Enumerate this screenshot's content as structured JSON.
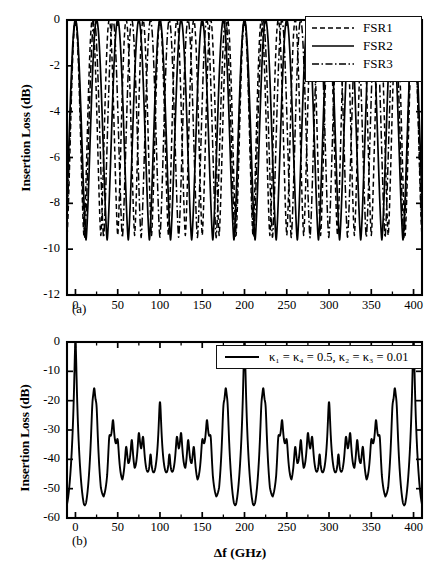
{
  "figure": {
    "xlabel": "Δf (GHz)",
    "panel_a_tag": "(a)",
    "panel_b_tag": "(b)"
  },
  "panel_a": {
    "ylabel": "Insertion Loss (dB)",
    "yticks": [
      "0",
      "-2",
      "-4",
      "-6",
      "-8",
      "-10",
      "-12"
    ],
    "xticks": [
      "0",
      "50",
      "100",
      "150",
      "200",
      "250",
      "300",
      "350",
      "400"
    ],
    "legend": [
      {
        "label": "FSR1",
        "style": "dashed"
      },
      {
        "label": "FSR2",
        "style": "solid"
      },
      {
        "label": "FSR3",
        "style": "dashdot"
      }
    ]
  },
  "panel_b": {
    "ylabel": "Insertion Loss (dB)",
    "yticks": [
      "0",
      "-10",
      "-20",
      "-30",
      "-40",
      "-50",
      "-60"
    ],
    "xticks": [
      "0",
      "50",
      "100",
      "150",
      "200",
      "250",
      "300",
      "350",
      "400"
    ],
    "legend_label": "κ₁ = κ₄ = 0.5, κ₂ = κ₃ = 0.01"
  },
  "chart_data": [
    {
      "type": "line",
      "panel": "(a)",
      "title": "",
      "xlabel": "Δf (GHz)",
      "ylabel": "Insertion Loss (dB)",
      "xlim": [
        -10,
        410
      ],
      "ylim": [
        -12,
        0
      ],
      "xticks": [
        0,
        50,
        100,
        150,
        200,
        250,
        300,
        350,
        400
      ],
      "yticks": [
        0,
        -2,
        -4,
        -6,
        -8,
        -10,
        -12
      ],
      "grid": false,
      "legend_position": "upper right",
      "series": [
        {
          "name": "FSR1",
          "style": "dashed",
          "period_ghz": 20,
          "max_db": 0,
          "min_db": -9.4,
          "phase_ghz": 0
        },
        {
          "name": "FSR2",
          "style": "solid",
          "period_ghz": 25,
          "max_db": 0,
          "min_db": -9.6,
          "phase_ghz": 0
        },
        {
          "name": "FSR3",
          "style": "dashdot",
          "period_ghz": 22.2,
          "max_db": 0,
          "min_db": -9.5,
          "phase_ghz": 0
        }
      ]
    },
    {
      "type": "line",
      "panel": "(b)",
      "title": "",
      "xlabel": "Δf (GHz)",
      "ylabel": "Insertion Loss (dB)",
      "xlim": [
        -10,
        410
      ],
      "ylim": [
        -60,
        0
      ],
      "xticks": [
        0,
        50,
        100,
        150,
        200,
        250,
        300,
        350,
        400
      ],
      "yticks": [
        0,
        -10,
        -20,
        -30,
        -40,
        -50,
        -60
      ],
      "grid": false,
      "legend_position": "upper right",
      "series": [
        {
          "name": "κ₁ = κ₄ = 0.5, κ₂ = κ₃ = 0.01",
          "style": "solid",
          "main_peak_spacing_ghz": 40,
          "main_peak_db": 0,
          "floor_db": -58,
          "main_peaks_ghz": [
            0,
            40,
            80,
            120,
            160,
            200,
            240,
            280,
            320,
            360,
            400
          ],
          "secondary_peaks": [
            {
              "x": 25,
              "y": -44
            },
            {
              "x": 50,
              "y": -27
            },
            {
              "x": 63,
              "y": -38
            },
            {
              "x": 75,
              "y": -38
            },
            {
              "x": 100,
              "y": -30
            },
            {
              "x": 125,
              "y": -38
            },
            {
              "x": 150,
              "y": -28
            },
            {
              "x": 175,
              "y": -44
            },
            {
              "x": 200,
              "y": -10
            },
            {
              "x": 225,
              "y": -44
            },
            {
              "x": 250,
              "y": -27
            },
            {
              "x": 300,
              "y": -30
            },
            {
              "x": 350,
              "y": -27
            },
            {
              "x": 375,
              "y": -44
            }
          ]
        }
      ]
    }
  ]
}
